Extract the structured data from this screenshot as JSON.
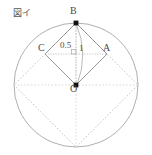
{
  "figure": {
    "caption": "図イ",
    "points": {
      "B": "B",
      "A": "A",
      "C": "C",
      "O": "O"
    },
    "measurements": {
      "half_diagonal": "0.5",
      "radius": "1"
    },
    "colors": {
      "circle_stroke": "#9a9a9a",
      "solid_line": "#8d8d8d",
      "dotted_line": "#b5b5b5",
      "point_fill": "#111111",
      "text": "#4a4a4a"
    }
  }
}
